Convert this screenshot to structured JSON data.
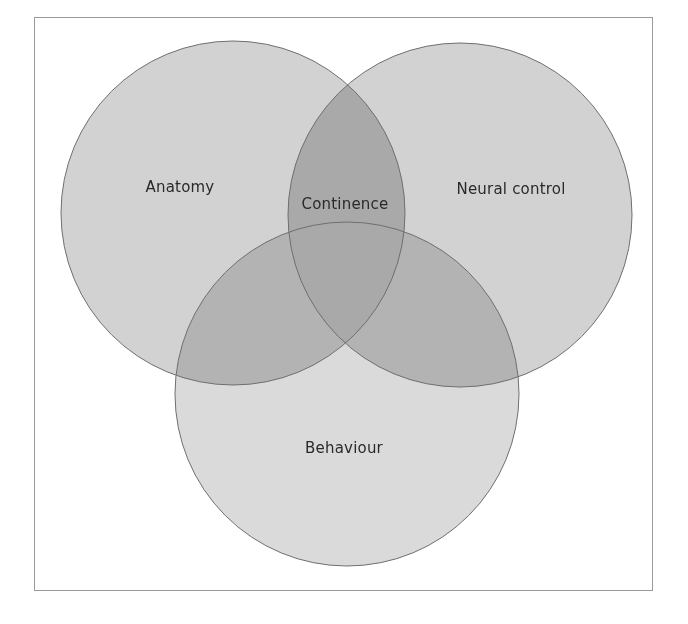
{
  "diagram": {
    "type": "venn",
    "sets": [
      {
        "id": "anatomy",
        "label": "Anatomy",
        "cx": 233,
        "cy": 213,
        "r": 172
      },
      {
        "id": "neural_control",
        "label": "Neural control",
        "cx": 460,
        "cy": 215,
        "r": 172
      },
      {
        "id": "behaviour",
        "label": "Behaviour",
        "cx": 347,
        "cy": 394,
        "r": 172
      }
    ],
    "center_label": "Continence",
    "labels": {
      "anatomy": "Anatomy",
      "neural_control": "Neural control",
      "behaviour": "Behaviour",
      "continence": "Continence"
    },
    "colors": {
      "circle_fill": "#d2d2d2",
      "circle_stroke": "#6f6f6f",
      "center_fill": "#a9a9a9",
      "frame_border": "#9a9a9a",
      "text": "#2a2a2a"
    }
  }
}
